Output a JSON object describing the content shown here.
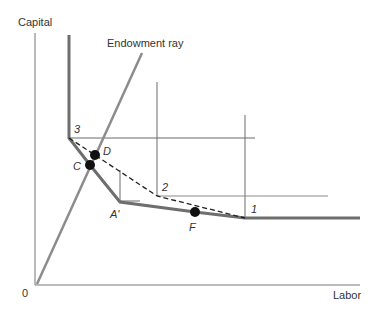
{
  "diagram": {
    "axes": {
      "y_label": "Capital",
      "x_label": "Labor",
      "origin_label": "0"
    },
    "ray_label": "Endowment ray",
    "points": {
      "p3": "3",
      "D": "D",
      "C": "C",
      "p2": "2",
      "A_prime": "A'",
      "F": "F",
      "p1": "1"
    },
    "colors": {
      "axis": "#7a7a7a",
      "isoquant": "#6e6e6e",
      "ray": "#8c8c8c",
      "thin_lines": "#6a6a6a",
      "dashed": "#222222",
      "dot": "#111111",
      "text": "#333333"
    }
  }
}
